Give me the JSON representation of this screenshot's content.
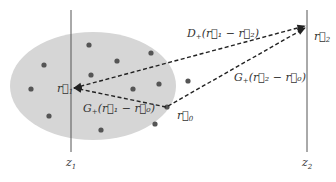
{
  "diagram": {
    "type": "scattering-geometry",
    "planes": [
      {
        "id": "z1",
        "label": "z",
        "subscript": "1"
      },
      {
        "id": "z2",
        "label": "z",
        "subscript": "2"
      }
    ],
    "points": [
      {
        "id": "r1",
        "label": "r",
        "subscript": "1"
      },
      {
        "id": "r2",
        "label": "r",
        "subscript": "2"
      },
      {
        "id": "r0",
        "label": "r",
        "subscript": "0"
      }
    ],
    "arrows": [
      {
        "id": "D-arrow",
        "from": "r1",
        "to": "r2",
        "label": "D₊(r⃗₁ − r⃗₂)"
      },
      {
        "id": "G20-arrow",
        "from": "r0",
        "to": "r2",
        "label": "G₊(r⃗₂ − r⃗₀)"
      },
      {
        "id": "G10-arrow",
        "from": "r0",
        "to": "r1",
        "label": "G₊(r⃗₁ − r⃗₀)"
      }
    ],
    "scatterer_count": 14,
    "colors": {
      "ellipse": "#d3d3d3",
      "dots": "#555555",
      "lines": "#444444"
    }
  },
  "labels": {
    "D_label_main": "D",
    "D_label_sub": "+",
    "D_label_args": "(r⃗₁ − r⃗₂)",
    "G20_label_main": "G",
    "G20_label_sub": "+",
    "G20_label_args": "(r⃗₂ − r⃗₀)",
    "G10_label_main": "G",
    "G10_label_sub": "+",
    "G10_label_args": "(r⃗₁ − r⃗₀)",
    "r1": "r⃗",
    "r1_sub": "1",
    "r2": "r⃗",
    "r2_sub": "2",
    "r0": "r⃗",
    "r0_sub": "0",
    "z1": "z",
    "z1_sub": "1",
    "z2": "z",
    "z2_sub": "2"
  }
}
